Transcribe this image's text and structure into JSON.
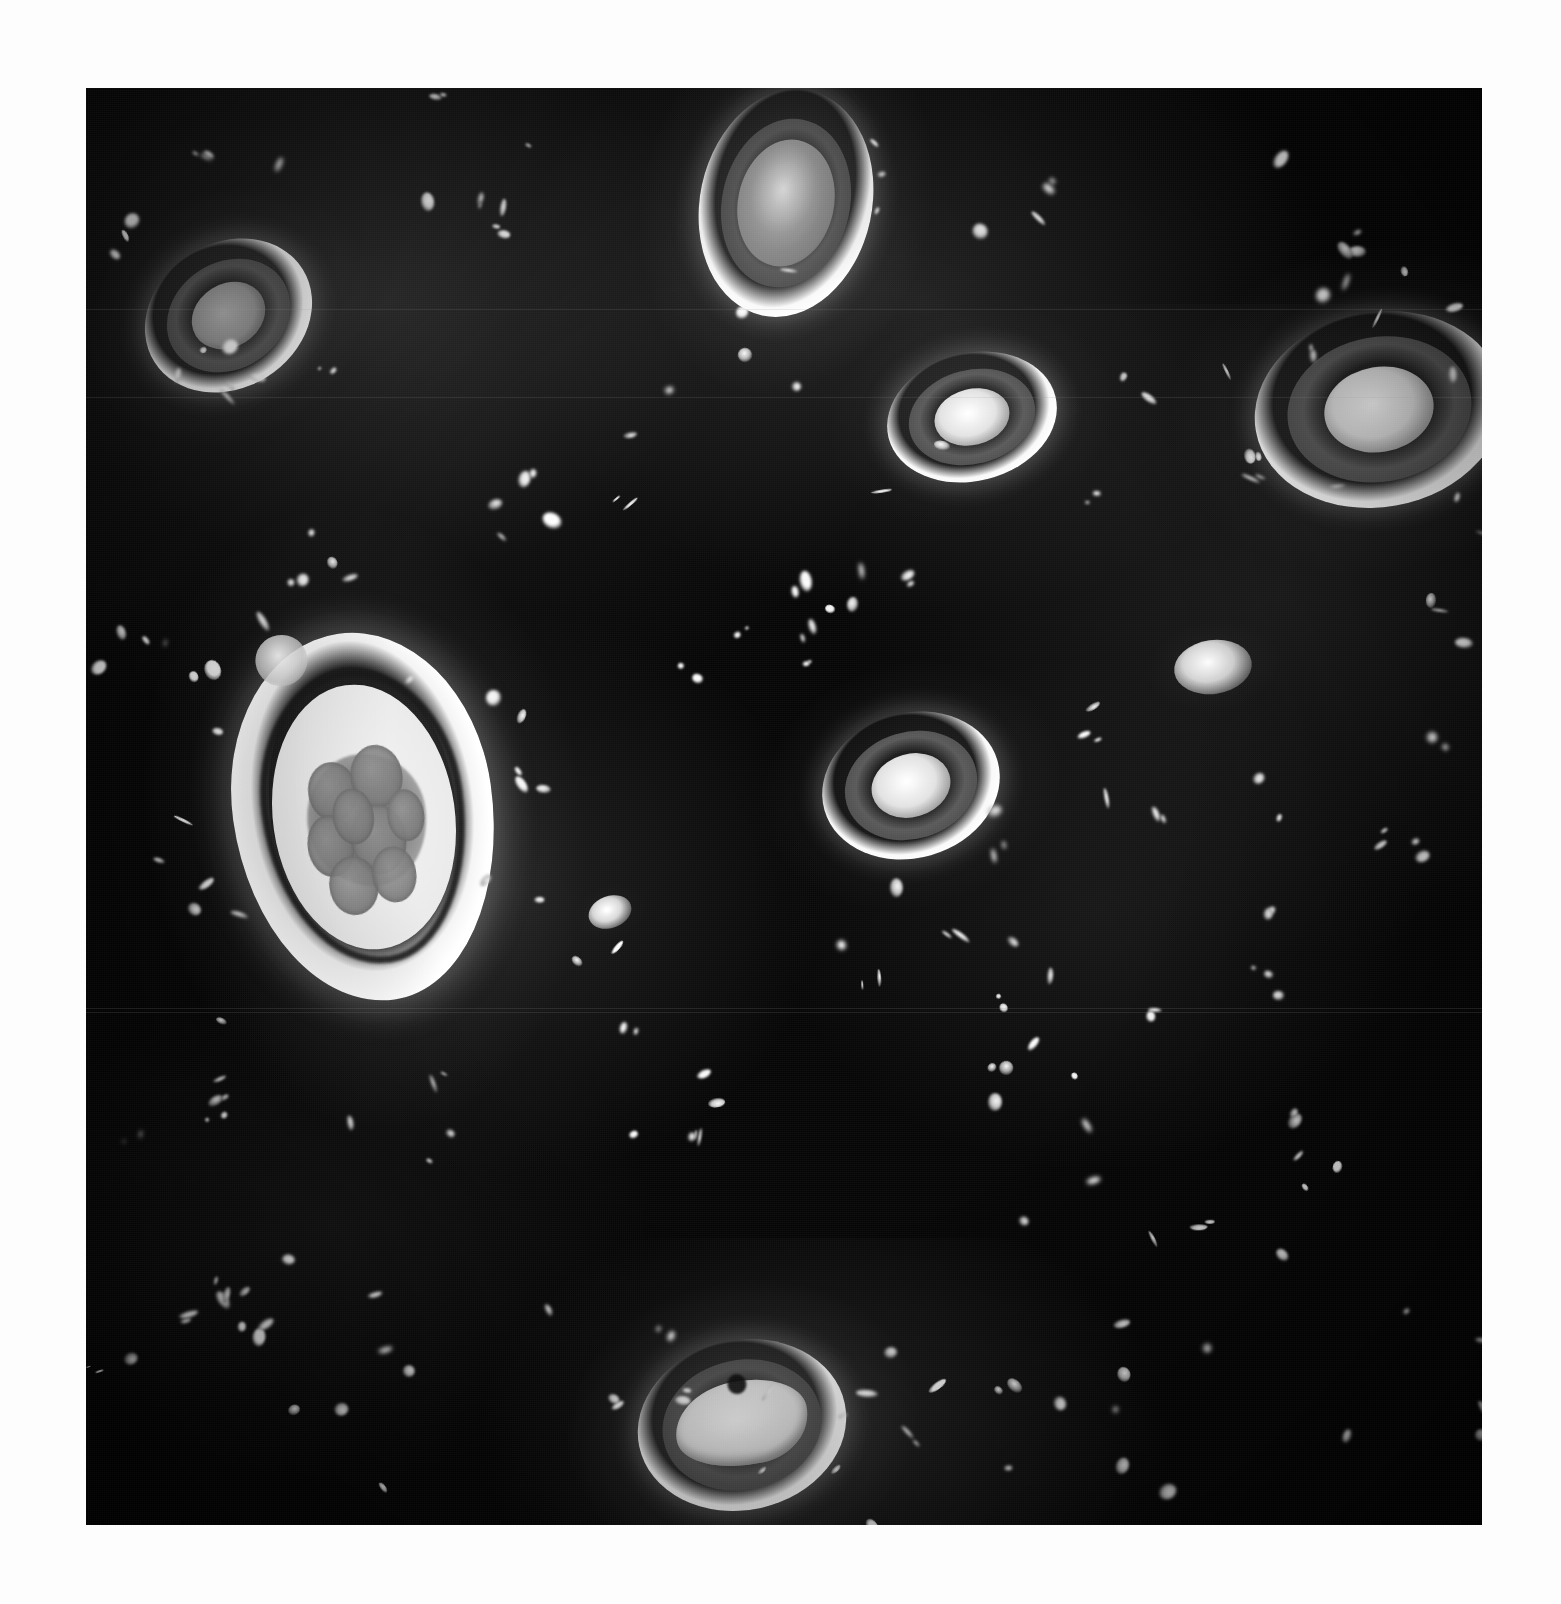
{
  "document": {
    "kind": "photomicrograph-plate",
    "page_background": "#fdfdfd",
    "caption": "",
    "title": ""
  },
  "plate": {
    "name": "dark-field-photomicrograph",
    "left": 86,
    "top": 88,
    "width": 1396,
    "height": 1437,
    "field_background": "#0a0a0a",
    "modality": "dark-field / phase-contrast light microscopy",
    "subject": "parasite ova and cysts with scattered particulate debris",
    "colors": {
      "field_dark": "#0a0a0a",
      "shell_bright": "#ffffff",
      "shell_mid": "#9a9a9a",
      "shell_shadow": "#4e4e4e",
      "debris_bright": "#e8e8e8",
      "paper": "#fdfdfd"
    },
    "scan_seams_y": [
      309,
      397,
      1008,
      1012
    ]
  },
  "organisms": [
    {
      "name": "ovum-upper-left",
      "left": 55,
      "top": 155,
      "width": 175,
      "height": 145,
      "rotate": -32,
      "ringStyle": "thick-bright-ring",
      "coreTone": "mid-grey",
      "haloStrength": 0.55
    },
    {
      "name": "ovum-top-center",
      "left": 614,
      "top": 0,
      "width": 172,
      "height": 230,
      "rotate": 12,
      "ringStyle": "thick-bright-ring",
      "coreTone": "mottled-grey",
      "haloStrength": 0.8
    },
    {
      "name": "ovum-upper-mid-right",
      "left": 800,
      "top": 265,
      "width": 172,
      "height": 128,
      "rotate": -14,
      "ringStyle": "concentric-triple",
      "coreTone": "bright",
      "haloStrength": 0.45
    },
    {
      "name": "ovum-upper-right-clipped",
      "left": 1168,
      "top": 224,
      "width": 250,
      "height": 195,
      "rotate": -10,
      "ringStyle": "concentric-triple",
      "coreTone": "bright",
      "haloStrength": 0.6
    },
    {
      "name": "ovum-large-embryonated",
      "left": 148,
      "top": 544,
      "width": 260,
      "height": 370,
      "rotate": -8,
      "ringStyle": "embryonated-multicell",
      "coreTone": "segmented-blastomeres",
      "haloStrength": 0.7
    },
    {
      "name": "ovum-center-right",
      "left": 735,
      "top": 625,
      "width": 180,
      "height": 145,
      "rotate": -16,
      "ringStyle": "concentric-triple",
      "coreTone": "bright",
      "haloStrength": 0.55
    },
    {
      "name": "ovum-small-right",
      "left": 1088,
      "top": 552,
      "width": 78,
      "height": 54,
      "rotate": -8,
      "ringStyle": "solid-bright-oval",
      "coreTone": "bright",
      "haloStrength": 0.3
    },
    {
      "name": "ovum-bottom-center-larva",
      "left": 551,
      "top": 1252,
      "width": 210,
      "height": 170,
      "rotate": -12,
      "ringStyle": "larvated",
      "coreTone": "coiled-larva",
      "haloStrength": 0.85
    },
    {
      "name": "particle-oval-mid",
      "left": 502,
      "top": 808,
      "width": 44,
      "height": 32,
      "rotate": -20,
      "ringStyle": "solid-bright-oval",
      "coreTone": "mid-grey",
      "haloStrength": 0.18
    }
  ],
  "debris": {
    "description": "scattered refractile particulate matter — bright punctate and comma-shaped artefacts throughout the dark field",
    "approximate_count": 190,
    "tone_range": [
      "#6a6a6a",
      "#ffffff"
    ]
  }
}
